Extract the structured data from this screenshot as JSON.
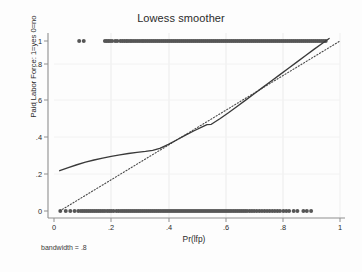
{
  "chart_data": {
    "type": "scatter",
    "title": "Lowess smoother",
    "xlabel": "Pr(lfp)",
    "ylabel": "Paid Labor Force: 1=yes 0=no",
    "caption": "bandwidth = .8",
    "xlim": [
      0,
      1
    ],
    "ylim": [
      0,
      1
    ],
    "grid": true,
    "legend": "none",
    "xticks": [
      "0",
      ".2",
      ".4",
      ".6",
      ".8",
      "1"
    ],
    "xtick_values": [
      0,
      0.2,
      0.4,
      0.6,
      0.8,
      1
    ],
    "yticks": [
      "0",
      ".2",
      ".4",
      ".6",
      ".8",
      "1"
    ],
    "ytick_values": [
      0,
      0.2,
      0.4,
      0.6,
      0.8,
      1
    ],
    "colors": {
      "points": "#555555",
      "smoother": "#3a3a3a",
      "reference": "#4a4a4a",
      "axis": "#8a8a8a",
      "grid": "#e8e8e8",
      "background": "#fdfdfd"
    },
    "series": [
      {
        "name": "observations y=1",
        "type": "scatter",
        "y": 1,
        "x": [
          0.088,
          0.104,
          0.178,
          0.184,
          0.19,
          0.196,
          0.203,
          0.214,
          0.221,
          0.232,
          0.239,
          0.246,
          0.253,
          0.259,
          0.266,
          0.272,
          0.279,
          0.286,
          0.293,
          0.3,
          0.307,
          0.313,
          0.32,
          0.327,
          0.334,
          0.341,
          0.348,
          0.355,
          0.362,
          0.369,
          0.376,
          0.383,
          0.39,
          0.397,
          0.404,
          0.411,
          0.418,
          0.425,
          0.432,
          0.439,
          0.446,
          0.453,
          0.46,
          0.467,
          0.474,
          0.481,
          0.488,
          0.495,
          0.502,
          0.509,
          0.516,
          0.523,
          0.53,
          0.537,
          0.544,
          0.551,
          0.558,
          0.565,
          0.572,
          0.579,
          0.586,
          0.593,
          0.6,
          0.607,
          0.614,
          0.621,
          0.628,
          0.635,
          0.642,
          0.649,
          0.656,
          0.663,
          0.67,
          0.677,
          0.684,
          0.691,
          0.698,
          0.705,
          0.712,
          0.719,
          0.726,
          0.733,
          0.74,
          0.747,
          0.754,
          0.761,
          0.768,
          0.775,
          0.782,
          0.789,
          0.796,
          0.803,
          0.81,
          0.817,
          0.824,
          0.831,
          0.838,
          0.845,
          0.852,
          0.859,
          0.866,
          0.873,
          0.88,
          0.887,
          0.894,
          0.901,
          0.908,
          0.915,
          0.922,
          0.929,
          0.936,
          0.943,
          0.95
        ]
      },
      {
        "name": "observations y=0",
        "type": "scatter",
        "y": 0,
        "x": [
          0.022,
          0.041,
          0.057,
          0.072,
          0.085,
          0.094,
          0.101,
          0.108,
          0.115,
          0.122,
          0.129,
          0.136,
          0.143,
          0.15,
          0.157,
          0.164,
          0.171,
          0.178,
          0.186,
          0.193,
          0.2,
          0.208,
          0.218,
          0.226,
          0.234,
          0.241,
          0.248,
          0.255,
          0.262,
          0.269,
          0.276,
          0.283,
          0.29,
          0.297,
          0.304,
          0.311,
          0.318,
          0.325,
          0.332,
          0.339,
          0.346,
          0.353,
          0.36,
          0.367,
          0.374,
          0.381,
          0.388,
          0.395,
          0.402,
          0.409,
          0.416,
          0.423,
          0.43,
          0.437,
          0.444,
          0.451,
          0.458,
          0.465,
          0.472,
          0.479,
          0.486,
          0.493,
          0.5,
          0.507,
          0.514,
          0.521,
          0.528,
          0.535,
          0.542,
          0.549,
          0.556,
          0.563,
          0.57,
          0.577,
          0.584,
          0.591,
          0.598,
          0.605,
          0.612,
          0.619,
          0.626,
          0.633,
          0.64,
          0.647,
          0.654,
          0.661,
          0.668,
          0.675,
          0.684,
          0.692,
          0.7,
          0.709,
          0.718,
          0.727,
          0.736,
          0.745,
          0.754,
          0.763,
          0.772,
          0.781,
          0.79,
          0.802,
          0.812,
          0.822,
          0.838,
          0.851,
          0.872,
          0.884,
          0.899
        ]
      },
      {
        "name": "lowess smoother",
        "type": "line",
        "x": [
          0.02,
          0.05,
          0.08,
          0.11,
          0.14,
          0.17,
          0.2,
          0.23,
          0.26,
          0.29,
          0.32,
          0.345,
          0.37,
          0.4,
          0.43,
          0.46,
          0.49,
          0.52,
          0.535,
          0.55,
          0.58,
          0.61,
          0.64,
          0.67,
          0.7,
          0.73,
          0.76,
          0.79,
          0.82,
          0.85,
          0.88,
          0.91,
          0.94,
          0.962
        ],
        "y": [
          0.237,
          0.255,
          0.272,
          0.287,
          0.3,
          0.311,
          0.321,
          0.33,
          0.338,
          0.345,
          0.351,
          0.357,
          0.368,
          0.392,
          0.419,
          0.446,
          0.472,
          0.496,
          0.508,
          0.51,
          0.543,
          0.578,
          0.615,
          0.652,
          0.69,
          0.727,
          0.765,
          0.802,
          0.84,
          0.877,
          0.915,
          0.952,
          0.988,
          1.015
        ]
      },
      {
        "name": "45-degree reference line",
        "type": "line",
        "style": "dotted",
        "x": [
          0.02,
          1.0
        ],
        "y": [
          0.0,
          1.0
        ]
      }
    ]
  }
}
